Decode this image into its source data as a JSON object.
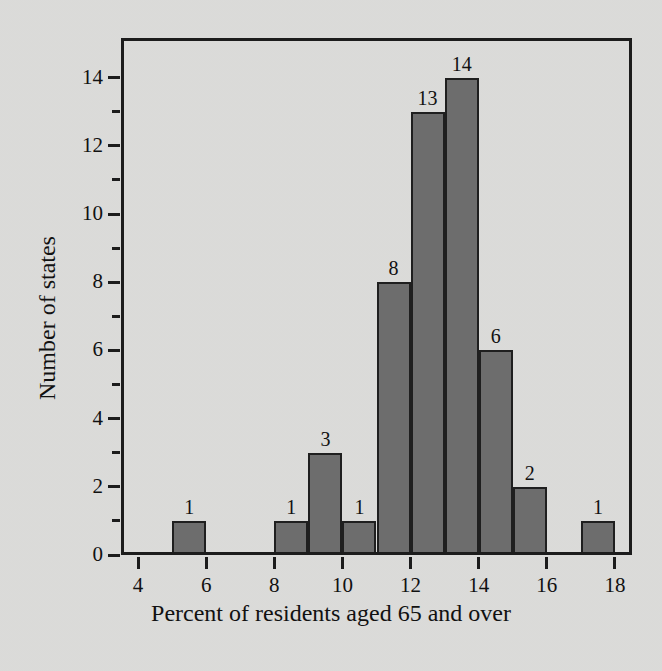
{
  "chart_data": {
    "type": "bar",
    "title": "",
    "subtitle": "",
    "xlabel": "Percent of residents aged 65 and over",
    "ylabel": "Number of states",
    "grid": false,
    "legend": null,
    "bin_width": 1,
    "xlim": [
      3.5,
      18.5
    ],
    "ylim": [
      0,
      15.2
    ],
    "xticks": [
      4,
      6,
      8,
      10,
      12,
      14,
      16,
      18
    ],
    "xtick_labels": [
      "4",
      "6",
      "8",
      "10",
      "12",
      "14",
      "16",
      "18"
    ],
    "yticks": [
      0,
      2,
      4,
      6,
      8,
      10,
      12,
      14
    ],
    "ytick_labels": [
      "0",
      "2",
      "4",
      "6",
      "8",
      "10",
      "12",
      "14"
    ],
    "yticks_minor": [
      1,
      3,
      5,
      7,
      9,
      11,
      13
    ],
    "bars": [
      {
        "bin_start": 5,
        "bin_end": 6,
        "value": 1,
        "label": "1"
      },
      {
        "bin_start": 8,
        "bin_end": 9,
        "value": 1,
        "label": "1"
      },
      {
        "bin_start": 9,
        "bin_end": 10,
        "value": 3,
        "label": "3"
      },
      {
        "bin_start": 10,
        "bin_end": 11,
        "value": 1,
        "label": "1"
      },
      {
        "bin_start": 11,
        "bin_end": 12,
        "value": 8,
        "label": "8"
      },
      {
        "bin_start": 12,
        "bin_end": 13,
        "value": 13,
        "label": "13"
      },
      {
        "bin_start": 13,
        "bin_end": 14,
        "value": 14,
        "label": "14"
      },
      {
        "bin_start": 14,
        "bin_end": 15,
        "value": 6,
        "label": "6"
      },
      {
        "bin_start": 15,
        "bin_end": 16,
        "value": 2,
        "label": "2"
      },
      {
        "bin_start": 17,
        "bin_end": 18,
        "value": 1,
        "label": "1"
      }
    ],
    "categories": [
      "5-6",
      "8-9",
      "9-10",
      "10-11",
      "11-12",
      "12-13",
      "13-14",
      "14-15",
      "15-16",
      "17-18"
    ],
    "values": [
      1,
      1,
      3,
      1,
      8,
      13,
      14,
      6,
      2,
      1
    ],
    "total_states": 50,
    "colors": {
      "background": "#dcdcda",
      "bar_fill": "#6d6d6d",
      "bar_edge": "#1f1f1f",
      "axis": "#1c1c1c",
      "text": "#111111"
    }
  }
}
